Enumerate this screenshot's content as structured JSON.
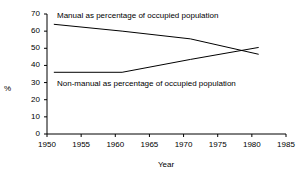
{
  "chart_data": {
    "type": "line",
    "title": "",
    "xlabel": "Year",
    "ylabel": "%",
    "xlim": [
      1950,
      1985
    ],
    "ylim": [
      0,
      70
    ],
    "grid": false,
    "legend_position": "inline-annotations",
    "xticks": [
      "1950",
      "1955",
      "1960",
      "1965",
      "1970",
      "1975",
      "1980",
      "1985"
    ],
    "xtick_values": [
      1950,
      1955,
      1960,
      1965,
      1970,
      1975,
      1980,
      1985
    ],
    "yticks": [
      "0",
      "10",
      "20",
      "30",
      "40",
      "50",
      "60",
      "70"
    ],
    "ytick_values": [
      0,
      10,
      20,
      30,
      40,
      50,
      60,
      70
    ],
    "line_color": "#000000",
    "axis_color": "#000000",
    "series": [
      {
        "name": "Manual as percentage of occupied population",
        "annotation": "Manual as percentage of occupied population",
        "x": [
          1951,
          1961,
          1971,
          1981
        ],
        "values": [
          64,
          60,
          55.5,
          46.5
        ]
      },
      {
        "name": "Non-manual as percentage of occupied population",
        "annotation": "Non-manual as percentage of occupied population",
        "x": [
          1951,
          1961,
          1971,
          1981
        ],
        "values": [
          36,
          36,
          43.5,
          50.5
        ]
      }
    ],
    "crossing_point": {
      "year": 1978.5,
      "value": 49
    }
  },
  "annotations": {
    "manual_label": "Manual as percentage of occupied population",
    "non_manual_label": "Non-manual as percentage of occupied population"
  },
  "axes": {
    "y_title": "%",
    "x_title": "Year"
  }
}
